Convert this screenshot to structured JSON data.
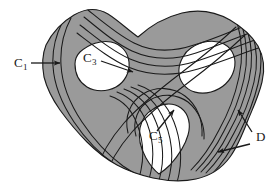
{
  "figure": {
    "kind": "topology-surface-diagram",
    "background_color": "#ffffff",
    "surface_fill": "#9a9a9a",
    "outline_color": "#1a1a1a",
    "hole_fill": "#ffffff",
    "curve_color": "#1a1a1a",
    "label_color": "#1a1a1a"
  },
  "labels": [
    {
      "id": "c1",
      "base": "C",
      "subscript": "1",
      "text": "C1",
      "x": 14,
      "y": 66,
      "sub_x": 23,
      "sub_y": 69
    },
    {
      "id": "c3",
      "base": "C",
      "subscript": "3",
      "text": "C3",
      "x": 83,
      "y": 62,
      "sub_x": 92,
      "sub_y": 65
    },
    {
      "id": "c5",
      "base": "C",
      "subscript": "5",
      "text": "C5",
      "x": 149,
      "y": 139,
      "sub_x": 158,
      "sub_y": 142
    },
    {
      "id": "d",
      "base": "D",
      "subscript": "",
      "text": "D",
      "x": 257,
      "y": 140,
      "sub_x": 0,
      "sub_y": 0
    }
  ],
  "arrows": [
    {
      "id": "arrow-c1",
      "from_label": "C1",
      "x1": 31,
      "y1": 63,
      "x2": 62,
      "y2": 63
    },
    {
      "id": "arrow-c3",
      "from_label": "C3",
      "x1": 101,
      "y1": 62,
      "x2": 135,
      "y2": 73
    },
    {
      "id": "arrow-c5",
      "from_label": "C5",
      "x1": 157,
      "y1": 131,
      "x2": 173,
      "y2": 110
    },
    {
      "id": "arrow-d-upper",
      "from_label": "D",
      "x1": 252,
      "y1": 132,
      "x2": 237,
      "y2": 109
    },
    {
      "id": "arrow-d-lower",
      "from_label": "D",
      "x1": 250,
      "y1": 144,
      "x2": 216,
      "y2": 152
    }
  ],
  "holes": [
    {
      "id": "hole-upper-left",
      "label": "C3",
      "cx": 96,
      "cy": 68,
      "shape": "rounded-blob"
    },
    {
      "id": "hole-upper-right",
      "label": "",
      "cx": 209,
      "cy": 67,
      "shape": "tilted-oval"
    },
    {
      "id": "hole-lower-center",
      "label": "C5",
      "cx": 160,
      "cy": 130,
      "shape": "teardrop"
    }
  ],
  "curve_families": [
    {
      "id": "curves-left-band",
      "count": 2,
      "label": "C1"
    },
    {
      "id": "curves-top-band",
      "count": 4,
      "label": "D"
    },
    {
      "id": "curves-right-band",
      "count": 5,
      "label": "D"
    },
    {
      "id": "curves-bottom-band",
      "count": 5,
      "label": "C5"
    },
    {
      "id": "curves-diagonal",
      "count": 2,
      "label": "C3"
    }
  ]
}
